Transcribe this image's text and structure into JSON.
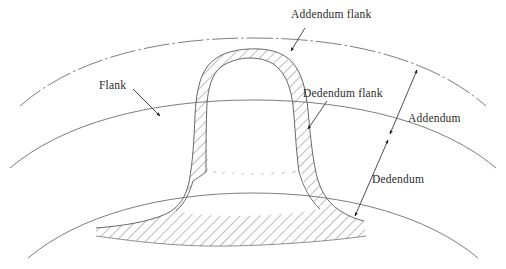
{
  "diagram": {
    "type": "engineering-line-drawing",
    "background_color": "#ffffff",
    "line_color": "#5a5a5a",
    "hatch_color": "#6b6b6b",
    "text_color": "#2b2b2b",
    "arrow_color": "#1a1a1a"
  },
  "labels": {
    "addendum_flank": "Addendum flank",
    "flank": "Flank",
    "dedendum_flank": "Dedendum flank",
    "addendum": "Addendum",
    "dedendum": "Dedendum"
  },
  "label_positions": {
    "addendum_flank": {
      "x": 291,
      "y": 9
    },
    "flank": {
      "x": 99,
      "y": 80
    },
    "dedendum_flank": {
      "x": 303,
      "y": 88
    },
    "addendum": {
      "x": 408,
      "y": 113
    },
    "dedendum": {
      "x": 372,
      "y": 174
    }
  },
  "circles": [
    {
      "name": "tip-circle",
      "label": "tip circle",
      "style": "dash-dot"
    },
    {
      "name": "pitch-circle",
      "label": "pitch circle",
      "style": "solid"
    },
    {
      "name": "root-circle",
      "label": "root circle",
      "style": "solid"
    }
  ],
  "dimensions": [
    {
      "name": "addendum",
      "label": "Addendum",
      "from": "pitch-circle",
      "to": "tip-circle"
    },
    {
      "name": "dedendum",
      "label": "Dedendum",
      "from": "pitch-circle",
      "to": "root-circle"
    }
  ],
  "leaders": [
    {
      "name": "addendum-flank-leader",
      "label": "Addendum flank",
      "points_to": "upper tooth flank above pitch circle"
    },
    {
      "name": "flank-leader",
      "label": "Flank",
      "points_to": "left tooth flank at pitch circle"
    },
    {
      "name": "dedendum-flank-leader",
      "label": "Dedendum flank",
      "points_to": "right tooth flank below pitch circle"
    }
  ]
}
